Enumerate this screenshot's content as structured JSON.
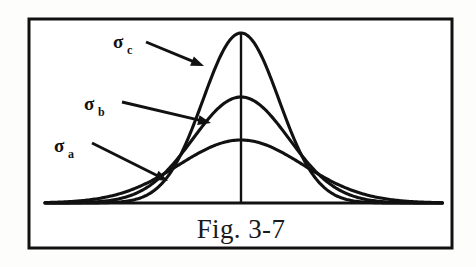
{
  "figure": {
    "caption": "Fig. 3-7",
    "background_color": "#fdfdfc",
    "panel_color": "#ffffff",
    "ink_color": "#111111",
    "frame": {
      "x": 29,
      "y": 19,
      "width": 423,
      "height": 229,
      "stroke_width": 3
    },
    "labels": [
      {
        "id": "sigma-c",
        "symbol": "σ",
        "subscript": "c",
        "text": "σc",
        "x": 113,
        "y": 48
      },
      {
        "id": "sigma-b",
        "symbol": "σ",
        "subscript": "b",
        "text": "σb",
        "x": 84,
        "y": 110
      },
      {
        "id": "sigma-a",
        "symbol": "σ",
        "subscript": "a",
        "text": "σa",
        "x": 54,
        "y": 152
      }
    ],
    "arrows": [
      {
        "id": "arrow-to-sigma-c",
        "points_to": "sigma-c",
        "x1": 146,
        "y1": 42,
        "x2": 204,
        "y2": 66
      },
      {
        "id": "arrow-to-sigma-b",
        "points_to": "sigma-b",
        "x1": 122,
        "y1": 102,
        "x2": 211,
        "y2": 123
      },
      {
        "id": "arrow-to-sigma-a",
        "points_to": "sigma-a",
        "x1": 92,
        "y1": 143,
        "x2": 168,
        "y2": 181
      }
    ]
  },
  "chart_data": {
    "type": "line",
    "title": "Fig. 3-7",
    "subtitle": "",
    "xlabel": "",
    "ylabel": "",
    "grid": false,
    "legend_position": "inline-annotations",
    "axis": {
      "baseline_y": 203,
      "baseline_x_start": 45,
      "baseline_x_end": 443,
      "center_line_x": 241,
      "center_line_y_top": 33,
      "center_line_y_bottom": 203,
      "stroke_width": 3
    },
    "xlim": [
      45,
      443
    ],
    "ylim": [
      0,
      1
    ],
    "series": [
      {
        "name": "σa",
        "label": "sigma a",
        "mean_x": 241,
        "sigma_px": 62,
        "peak_y": 140,
        "peak_height_norm": 0.37,
        "stroke_width": 3.1,
        "note": "widest spread, lowest peak"
      },
      {
        "name": "σb",
        "label": "sigma b",
        "mean_x": 241,
        "sigma_px": 48,
        "peak_y": 97,
        "peak_height_norm": 0.62,
        "stroke_width": 3.1,
        "note": "intermediate spread and peak"
      },
      {
        "name": "σc",
        "label": "sigma c",
        "mean_x": 241,
        "sigma_px": 38,
        "peak_y": 33,
        "peak_height_norm": 1.0,
        "stroke_width": 3.1,
        "note": "narrowest spread, tallest peak"
      }
    ]
  }
}
